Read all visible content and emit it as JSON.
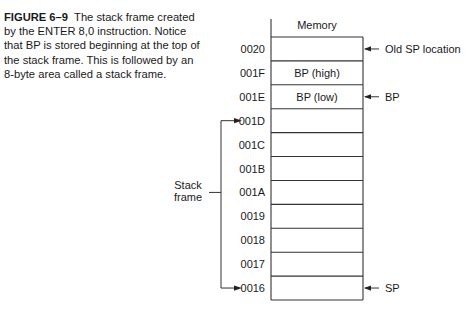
{
  "caption": {
    "figure_label": "FIGURE 6–9",
    "text": "The stack frame created by the ENTER 8,0 instruction. Notice that BP is stored beginning at the top of the stack frame. This is followed by an 8-byte area called a stack frame."
  },
  "diagram": {
    "column_header": "Memory",
    "rows": [
      {
        "address": "0020",
        "content": ""
      },
      {
        "address": "001F",
        "content": "BP (high)"
      },
      {
        "address": "001E",
        "content": "BP (low)"
      },
      {
        "address": "001D",
        "content": ""
      },
      {
        "address": "001C",
        "content": ""
      },
      {
        "address": "001B",
        "content": ""
      },
      {
        "address": "001A",
        "content": ""
      },
      {
        "address": "0019",
        "content": ""
      },
      {
        "address": "0018",
        "content": ""
      },
      {
        "address": "0017",
        "content": ""
      },
      {
        "address": "0016",
        "content": ""
      }
    ],
    "pointers": [
      {
        "row": 0,
        "label": "Old SP location"
      },
      {
        "row": 2,
        "label": "BP"
      },
      {
        "row": 10,
        "label": "SP"
      }
    ],
    "bracket": {
      "label_line1": "Stack",
      "label_line2": "frame",
      "from_row": 3,
      "to_row": 10
    }
  }
}
